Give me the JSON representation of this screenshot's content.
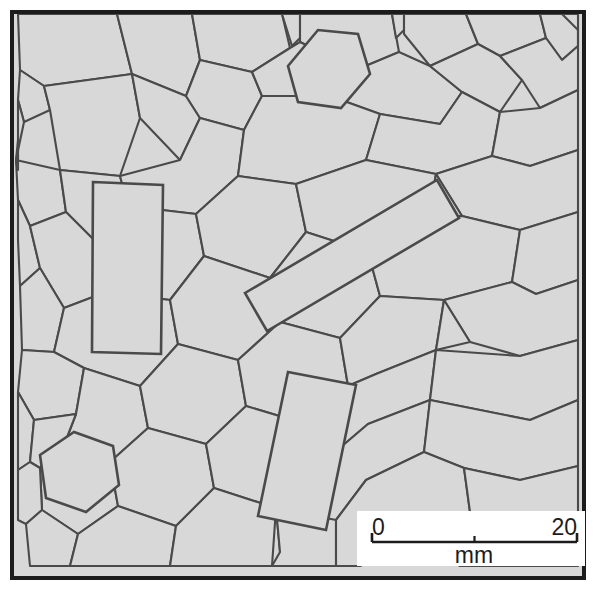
{
  "colors": {
    "background": "#ffffff",
    "grain_fill": "#d8d8d8",
    "grain_stroke": "#4a4a4a",
    "frame_stroke": "#1c1c1c",
    "scalebar_box": "#ffffff",
    "scalebar_line": "#1c1c1c",
    "text": "#1c1c1c"
  },
  "frame": {
    "x": 10,
    "y": 10,
    "width": 576,
    "height": 570,
    "stroke_width": 4
  },
  "scale_bar": {
    "box": {
      "x": 357,
      "y": 511,
      "width": 228,
      "height": 55
    },
    "bar": {
      "x1": 372,
      "x2": 577,
      "y": 542,
      "tick_height": 9,
      "mid_tick_height": 6
    },
    "min_label": "0",
    "max_label": "20",
    "unit_label": "mm",
    "min_value": 0,
    "max_value": 20,
    "units": "mm",
    "min_label_pos": {
      "x": 372,
      "y": 535
    },
    "max_label_pos": {
      "x": 577,
      "y": 535
    },
    "unit_label_pos": {
      "x": 474,
      "y": 563
    }
  },
  "grains": {
    "fill": "#d8d8d8",
    "stroke": "#4a4a4a",
    "stroke_width": 2.1,
    "phenocryst_stroke_width": 2.6,
    "count_note": "polygonal grains",
    "polygons": [
      "18,14 117,14 132,74 44,86 20,70",
      "117,14 192,14 200,60 186,96 132,74",
      "192,14 282,14 290,48 252,72 200,60",
      "282,14 300,14 300,38 292,46",
      "300,14 392,14 399,52 356,70 300,42",
      "392,14 404,14 404,30 396,38",
      "404,14 466,14 478,44 430,66 404,34",
      "466,14 540,14 546,38 500,56 478,44",
      "540,14 578,14 578,46 562,60 546,38",
      "20,70 44,86 50,110 24,122 18,100",
      "18,100 24,122 16,160 18,170 18,100",
      "44,86 132,74 140,118 120,176 60,170 50,110",
      "132,74 186,96 200,118 180,160 140,118",
      "186,96 200,60 252,72 262,96 244,130 200,118",
      "252,72 290,48 300,42 356,70 330,96 290,110 262,96",
      "356,70 399,52 430,66 462,92 440,124 380,114 330,96",
      "430,66 478,44 500,56 522,80 500,112 462,92",
      "500,56 546,38 562,60 578,46 578,90 540,108 522,80",
      "16,160 60,170 66,212 30,226 18,200",
      "60,170 120,176 128,206 96,242 66,212",
      "120,176 180,160 200,118 244,130 238,176 196,214 128,206",
      "244,130 262,96 330,96 380,114 366,160 296,184 238,176",
      "380,114 440,124 462,92 500,112 492,156 436,174 366,160",
      "500,112 540,108 578,90 578,150 530,166 492,156",
      "18,200 30,226 40,268 20,286 18,240",
      "30,226 66,212 96,242 106,292 64,308 40,268",
      "96,242 128,206 196,214 204,256 170,300 106,292",
      "196,214 238,176 296,184 306,232 270,278 204,256",
      "296,184 366,160 436,174 428,220 368,252 306,232",
      "436,174 492,156 530,166 578,150 578,212 520,230 462,216",
      "436,174 462,216 428,220",
      "20,286 40,268 64,308 54,352 22,350",
      "64,308 106,292 170,300 178,344 140,386 84,368 54,352",
      "170,300 204,256 270,278 280,322 238,360 178,344",
      "270,278 306,232 368,252 380,296 340,338 280,322",
      "368,252 428,220 462,216 520,230 512,282 444,300 380,296",
      "520,230 578,212 578,280 536,294 512,282",
      "22,350 54,352 84,368 76,414 34,420 18,392",
      "84,368 140,386 148,428 110,462 66,440 76,414",
      "140,386 178,344 238,360 246,406 206,444 148,428",
      "238,360 280,322 340,338 348,386 306,424 246,406",
      "340,338 380,296 444,300 436,350 376,374 348,386",
      "444,300 512,282 536,294 578,280 578,340 520,356 470,342",
      "444,300 470,342 436,350",
      "18,392 34,420 30,462 18,470",
      "34,420 76,414 66,440 40,468 30,462",
      "66,440 110,462 118,506 78,534 42,510 40,468",
      "110,462 148,428 206,444 214,488 176,526 118,506",
      "206,444 246,406 306,424 314,470 276,508 214,488",
      "306,424 348,386 376,374 436,350 430,400 368,424 314,470",
      "436,350 520,356 578,340 578,400 530,420 470,408 430,400",
      "18,470 30,462 40,468 42,510 26,524 18,520",
      "42,510 78,534 70,566 30,566 26,524",
      "78,534 118,506 176,526 170,566 112,566 70,566",
      "176,526 214,488 276,508 272,566 204,566 170,566",
      "276,508 314,470 368,424 430,400 424,452 366,480 336,520 280,552",
      "276,508 280,552 272,566 336,566 336,520",
      "430,400 470,408 530,420 578,400 578,466 520,480 464,468 424,452",
      "336,520 366,480 424,452 464,468 470,512 420,540 360,566 336,566",
      "464,468 520,480 578,466 578,520 530,532 470,512",
      "470,512 530,532 578,520 578,566 520,566 460,566 420,540",
      "18,170 16,160 18,140",
      "578,46 578,14 562,14 578,30"
    ],
    "phenocrysts": [
      {
        "name": "large-vertical-phenocryst",
        "points": "93,182 163,185 161,354 92,352"
      },
      {
        "name": "large-diagonal-phenocryst",
        "points": "245,293 437,180 459,218 267,331"
      },
      {
        "name": "medium-vertical-phenocryst",
        "points": "288,372 356,385 326,530 258,516"
      },
      {
        "name": "hexagon-grain-lower-left",
        "points": "40,455 74,432 113,446 119,485 86,512 46,498"
      },
      {
        "name": "hexagon-grain-top-center",
        "points": "288,66 318,30 358,34 370,74 341,108 298,102"
      }
    ]
  }
}
